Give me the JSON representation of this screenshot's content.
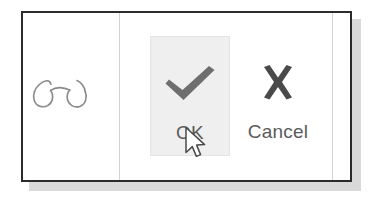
{
  "window": {
    "background_color": "#ffffff",
    "border_color": "#2b2b2b",
    "shadow_color": "#d9d9d9"
  },
  "panes": {
    "left": {
      "icon_name": "glasses-icon",
      "icon_color": "#8a8a8a"
    }
  },
  "commands": [
    {
      "id": "ok",
      "label": "OK",
      "icon": "checkmark-icon",
      "icon_color": "#6e6e6e",
      "state": "highlighted",
      "highlight_color": "#efefef"
    },
    {
      "id": "cancel",
      "label": "Cancel",
      "icon": "close-x-icon",
      "icon_color": "#4a4a4a",
      "state": "normal",
      "highlight_color": "#ffffff"
    }
  ],
  "cursor": {
    "type": "arrow-pointer",
    "x": 186,
    "y": 128
  },
  "colors": {
    "separator": "#d2d2d2",
    "label_text": "#5b5b5b"
  }
}
